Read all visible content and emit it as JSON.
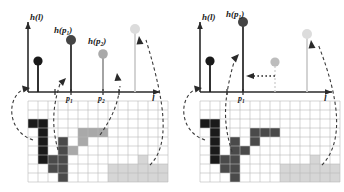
{
  "figure": {
    "type": "diagram",
    "panels": [
      {
        "id": "left",
        "name": "before-merge",
        "axis": {
          "ylabel": "h(l)",
          "xlabel": "l",
          "tick_labels": [
            "p1",
            "p2"
          ],
          "tick_label_display": [
            "p",
            "p"
          ],
          "tick_subscripts": [
            "1",
            "2"
          ]
        },
        "stem_labels": [
          {
            "text": "h(p",
            "sub": "1",
            "close": ")"
          },
          {
            "text": "h(p",
            "sub": "2",
            "close": ")"
          }
        ],
        "stems": [
          {
            "name": "stem-dark-small",
            "x": 38,
            "height": 31,
            "color": "#1a1a1a",
            "stem_color": "#1a1a1a"
          },
          {
            "name": "stem-dark-tall",
            "x": 71,
            "height": 52,
            "color": "#454545",
            "stem_color": "#2e2e2e"
          },
          {
            "name": "stem-mid-gray",
            "x": 103,
            "height": 38,
            "color": "#a9a9a9",
            "stem_color": "#9a9a9a"
          },
          {
            "name": "stem-light-gray",
            "x": 135,
            "height": 63,
            "color": "#dcdcdc",
            "stem_color": "#cfcfcf"
          }
        ],
        "arrows": [
          {
            "name": "arrow-to-stem-1",
            "from": "region-black",
            "to": "stem-dark-small"
          },
          {
            "name": "arrow-to-stem-2",
            "from": "region-dark",
            "to": "stem-dark-tall"
          },
          {
            "name": "arrow-to-stem-3",
            "from": "region-mid",
            "to": "stem-mid-gray"
          },
          {
            "name": "arrow-to-stem-4",
            "from": "region-light",
            "to": "stem-light-gray"
          }
        ]
      },
      {
        "id": "right",
        "name": "after-merge",
        "axis": {
          "ylabel": "h(l)",
          "xlabel": "l",
          "tick_labels": [
            "p1"
          ],
          "tick_label_display": [
            "p"
          ],
          "tick_subscripts": [
            "1"
          ]
        },
        "stem_labels": [
          {
            "text": "h(p",
            "sub": "1",
            "close": ")"
          }
        ],
        "stems": [
          {
            "name": "stem-dark-small",
            "x": 38,
            "height": 31,
            "color": "#1a1a1a",
            "stem_color": "#1a1a1a"
          },
          {
            "name": "stem-dark-tall",
            "x": 71,
            "height": 70,
            "color": "#454545",
            "stem_color": "#2e2e2e"
          },
          {
            "name": "stem-mid-gray",
            "x": 103,
            "height": 30,
            "color": "#bdbdbd",
            "stem_color": "#d2d2d2"
          },
          {
            "name": "stem-light-gray",
            "x": 135,
            "height": 58,
            "color": "#dcdcdc",
            "stem_color": "#cfcfcf"
          }
        ],
        "merge_arrow": {
          "name": "dotted-merge-arrow",
          "style": "dotted",
          "direction": "left"
        }
      }
    ],
    "grid": {
      "cols": 14,
      "rows": 9,
      "line_color": "#b9b9b9",
      "background": "#ffffff"
    },
    "palette": {
      "black": "#1a1a1a",
      "dark_gray": "#4a4a4a",
      "mid_gray": "#a9a9a9",
      "light_gray": "#d6d6d6",
      "axis": "#2a2a2a",
      "dashed": "#3a3a3a"
    },
    "left_grid_cells": {
      "black": [
        [
          0,
          2
        ],
        [
          1,
          2
        ],
        [
          0,
          3
        ],
        [
          1,
          3
        ],
        [
          1,
          4
        ],
        [
          1,
          5
        ],
        [
          1,
          6
        ]
      ],
      "dark_gray": [
        [
          3,
          4
        ],
        [
          3,
          5
        ],
        [
          2,
          6
        ],
        [
          3,
          6
        ],
        [
          2,
          7
        ],
        [
          3,
          7
        ],
        [
          3,
          8
        ]
      ],
      "mid_gray": [
        [
          5,
          3
        ],
        [
          6,
          3
        ],
        [
          7,
          3
        ],
        [
          5,
          4
        ],
        [
          4,
          5
        ]
      ],
      "light_gray": [
        [
          11,
          6
        ],
        [
          8,
          7
        ],
        [
          9,
          7
        ],
        [
          10,
          7
        ],
        [
          11,
          7
        ],
        [
          12,
          7
        ],
        [
          13,
          7
        ],
        [
          8,
          8
        ],
        [
          9,
          8
        ],
        [
          10,
          8
        ],
        [
          11,
          8
        ],
        [
          12,
          8
        ],
        [
          13,
          8
        ]
      ]
    },
    "right_grid_cells": {
      "black": [
        [
          0,
          2
        ],
        [
          1,
          2
        ],
        [
          0,
          3
        ],
        [
          1,
          3
        ],
        [
          1,
          4
        ],
        [
          1,
          5
        ],
        [
          1,
          6
        ]
      ],
      "dark_gray": [
        [
          5,
          3
        ],
        [
          6,
          3
        ],
        [
          7,
          3
        ],
        [
          5,
          4
        ],
        [
          4,
          5
        ],
        [
          3,
          4
        ],
        [
          3,
          5
        ],
        [
          2,
          6
        ],
        [
          3,
          6
        ],
        [
          2,
          7
        ],
        [
          3,
          7
        ],
        [
          3,
          8
        ]
      ],
      "light_gray": [
        [
          11,
          6
        ],
        [
          8,
          7
        ],
        [
          9,
          7
        ],
        [
          10,
          7
        ],
        [
          11,
          7
        ],
        [
          12,
          7
        ],
        [
          13,
          7
        ],
        [
          8,
          8
        ],
        [
          9,
          8
        ],
        [
          10,
          8
        ],
        [
          11,
          8
        ],
        [
          12,
          8
        ],
        [
          13,
          8
        ]
      ]
    }
  }
}
